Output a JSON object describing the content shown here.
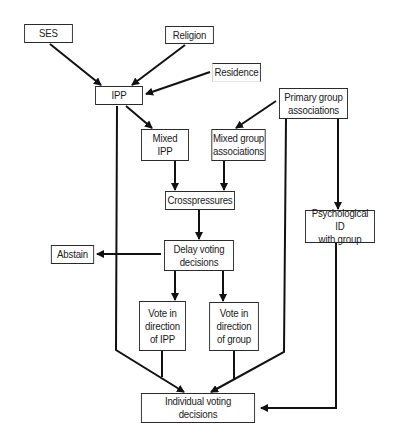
{
  "diagram": {
    "nodes": {
      "ses": {
        "label": "SES",
        "x": 22,
        "y": 24,
        "w": 53,
        "h": 19
      },
      "religion": {
        "label": "Religion",
        "x": 163,
        "y": 26,
        "w": 53,
        "h": 18
      },
      "residence": {
        "label": "Residence",
        "x": 210,
        "y": 63,
        "w": 53,
        "h": 19
      },
      "ipp": {
        "label": "IPP",
        "x": 93,
        "y": 86,
        "w": 52,
        "h": 19
      },
      "primary_group": {
        "label": "Primary group\nassociations",
        "x": 276,
        "y": 88,
        "w": 75,
        "h": 31
      },
      "mixed_ipp": {
        "label": "Mixed\nIPP",
        "x": 139,
        "y": 129,
        "w": 52,
        "h": 32
      },
      "mixed_group": {
        "label": "Mixed group\nassociations",
        "x": 209,
        "y": 129,
        "w": 59,
        "h": 32
      },
      "crosspressures": {
        "label": "Crosspressures",
        "x": 162,
        "y": 191,
        "w": 76,
        "h": 19
      },
      "psych_id": {
        "label": "Psychological ID\nwith group",
        "x": 302,
        "y": 210,
        "w": 76,
        "h": 33
      },
      "abstain": {
        "label": "Abstain",
        "x": 49,
        "y": 245,
        "w": 47,
        "h": 19
      },
      "delay": {
        "label": "Delay voting\ndecisions",
        "x": 161,
        "y": 240,
        "w": 76,
        "h": 31
      },
      "vote_ipp": {
        "label": "Vote in\ndirection\nof IPP",
        "x": 137,
        "y": 301,
        "w": 51,
        "h": 50
      },
      "vote_group": {
        "label": "Vote in\ndirection\nof group",
        "x": 207,
        "y": 302,
        "w": 54,
        "h": 49
      },
      "individual": {
        "label": "Individual voting\ndecisions",
        "x": 136,
        "y": 393,
        "w": 124,
        "h": 30
      }
    },
    "edges": [
      {
        "from": "SES",
        "to": "IPP"
      },
      {
        "from": "Religion",
        "to": "IPP"
      },
      {
        "from": "Residence",
        "to": "IPP"
      },
      {
        "from": "IPP",
        "to": "Mixed IPP"
      },
      {
        "from": "IPP",
        "to": "Individual voting decisions"
      },
      {
        "from": "Primary group associations",
        "to": "Mixed group associations"
      },
      {
        "from": "Primary group associations",
        "to": "Individual voting decisions"
      },
      {
        "from": "Primary group associations",
        "to": "Psychological ID with group"
      },
      {
        "from": "Mixed IPP",
        "to": "Crosspressures"
      },
      {
        "from": "Mixed group associations",
        "to": "Crosspressures"
      },
      {
        "from": "Crosspressures",
        "to": "Delay voting decisions"
      },
      {
        "from": "Delay voting decisions",
        "to": "Abstain"
      },
      {
        "from": "Delay voting decisions",
        "to": "Vote in direction of IPP"
      },
      {
        "from": "Delay voting decisions",
        "to": "Vote in direction of group"
      },
      {
        "from": "Vote in direction of IPP",
        "to": "Individual voting decisions"
      },
      {
        "from": "Vote in direction of group",
        "to": "Individual voting decisions"
      },
      {
        "from": "Psychological ID with group",
        "to": "Individual voting decisions"
      }
    ],
    "colors": {
      "stroke": "#111111",
      "background": "#ffffff",
      "text": "#1a1a1a"
    }
  }
}
